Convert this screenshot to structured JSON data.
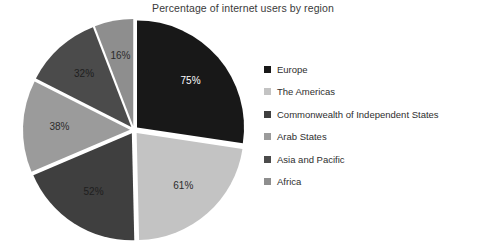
{
  "chart_data": {
    "type": "pie",
    "title": "Percentage of internet users by region",
    "xlabel": "",
    "ylabel": "",
    "legend_position": "right",
    "grid": false,
    "exploded": true,
    "categories": [
      "Europe",
      "The Americas",
      "Commonwealth of Independent States",
      "Arab States",
      "Asia and Pacific",
      "Africa"
    ],
    "values": [
      75,
      61,
      52,
      38,
      32,
      16
    ],
    "data_labels": [
      "75%",
      "61%",
      "52%",
      "38%",
      "32%",
      "16%"
    ],
    "colors": [
      "#181818",
      "#c3c3c3",
      "#3f3f3f",
      "#9b9b9b",
      "#4b4b4b",
      "#8e8e8e"
    ],
    "label_colors": [
      "#ffffff",
      "#2b2b2b",
      "#1e1e1e",
      "#2b2b2b",
      "#1e1e1e",
      "#2b2b2b"
    ]
  },
  "legend": {
    "items": [
      {
        "label": "Europe",
        "color": "#181818"
      },
      {
        "label": "The Americas",
        "color": "#c3c3c3"
      },
      {
        "label": "Commonwealth of Independent States",
        "color": "#3f3f3f"
      },
      {
        "label": "Arab States",
        "color": "#9b9b9b"
      },
      {
        "label": "Asia and Pacific",
        "color": "#4b4b4b"
      },
      {
        "label": "Africa",
        "color": "#8e8e8e"
      }
    ]
  }
}
